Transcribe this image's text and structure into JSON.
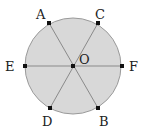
{
  "diagram": {
    "type": "circle-with-diameters",
    "fill_color": "#d8d8d8",
    "stroke_color": "#9a9a9a",
    "line_color": "#8a8a8a",
    "point_color": "#111111",
    "center": {
      "label": "O",
      "x": 73,
      "y": 66
    },
    "radius": 48,
    "points": [
      {
        "label": "A",
        "x": 49,
        "y": 23,
        "lx": 40,
        "ly": 17
      },
      {
        "label": "C",
        "x": 98,
        "y": 23,
        "lx": 97,
        "ly": 17
      },
      {
        "label": "E",
        "x": 25,
        "y": 66,
        "lx": 8,
        "ly": 71
      },
      {
        "label": "F",
        "x": 122,
        "y": 66,
        "lx": 130,
        "ly": 71
      },
      {
        "label": "D",
        "x": 50,
        "y": 108,
        "lx": 43,
        "ly": 126
      },
      {
        "label": "B",
        "x": 98,
        "y": 108,
        "lx": 101,
        "ly": 126
      }
    ],
    "segments": [
      [
        "A",
        "B"
      ],
      [
        "C",
        "D"
      ],
      [
        "E",
        "F"
      ]
    ],
    "center_label": {
      "text": "O",
      "x": 80,
      "y": 63
    }
  }
}
